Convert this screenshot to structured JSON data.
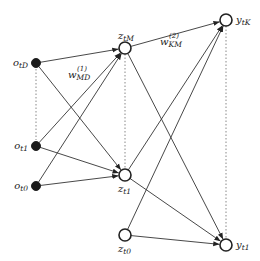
{
  "diagram": {
    "type": "neural-network",
    "colors": {
      "edge": "#333333",
      "dotted": "#888888",
      "input_fill": "#1a1a1a",
      "node_stroke": "#222222"
    },
    "nodes": [
      {
        "id": "o_tD",
        "label": "o",
        "sub": "tD",
        "layer": "input",
        "x": 36,
        "y": 63,
        "filled": true,
        "label_pos": "left"
      },
      {
        "id": "o_t1",
        "label": "o",
        "sub": "t1",
        "layer": "input",
        "x": 36,
        "y": 146,
        "filled": true,
        "label_pos": "left"
      },
      {
        "id": "o_t0",
        "label": "o",
        "sub": "t0",
        "layer": "input",
        "x": 36,
        "y": 186,
        "filled": true,
        "label_pos": "left"
      },
      {
        "id": "z_tM",
        "label": "z",
        "sub": "tM",
        "layer": "hidden",
        "x": 125,
        "y": 48,
        "filled": false,
        "label_pos": "top"
      },
      {
        "id": "z_t1",
        "label": "z",
        "sub": "t1",
        "layer": "hidden",
        "x": 125,
        "y": 175,
        "filled": false,
        "label_pos": "bottom"
      },
      {
        "id": "z_t0",
        "label": "z",
        "sub": "t0",
        "layer": "hidden",
        "x": 125,
        "y": 235,
        "filled": false,
        "label_pos": "bottom"
      },
      {
        "id": "y_tK",
        "label": "y",
        "sub": "tK",
        "layer": "output",
        "x": 226,
        "y": 20,
        "filled": false,
        "label_pos": "right"
      },
      {
        "id": "y_t1",
        "label": "y",
        "sub": "t1",
        "layer": "output",
        "x": 226,
        "y": 245,
        "filled": false,
        "label_pos": "right"
      }
    ],
    "edges": [
      {
        "from": "o_tD",
        "to": "z_tM"
      },
      {
        "from": "o_tD",
        "to": "z_t1"
      },
      {
        "from": "o_t1",
        "to": "z_tM"
      },
      {
        "from": "o_t1",
        "to": "z_t1"
      },
      {
        "from": "o_t0",
        "to": "z_tM"
      },
      {
        "from": "o_t0",
        "to": "z_t1"
      },
      {
        "from": "z_tM",
        "to": "y_tK"
      },
      {
        "from": "z_tM",
        "to": "y_t1"
      },
      {
        "from": "z_t1",
        "to": "y_tK"
      },
      {
        "from": "z_t1",
        "to": "y_t1"
      },
      {
        "from": "z_t0",
        "to": "y_tK"
      },
      {
        "from": "z_t0",
        "to": "y_t1"
      }
    ],
    "dotted": [
      {
        "from": "o_tD",
        "to": "o_t1"
      },
      {
        "from": "z_tM",
        "to": "z_t1"
      },
      {
        "from": "y_tK",
        "to": "y_t1"
      }
    ],
    "weight_labels": [
      {
        "id": "w1",
        "base": "w",
        "sup": "(1)",
        "sub": "MD",
        "x": 68,
        "y": 78
      },
      {
        "id": "w2",
        "base": "w",
        "sup": "(2)",
        "sub": "KM",
        "x": 160,
        "y": 45
      }
    ]
  }
}
